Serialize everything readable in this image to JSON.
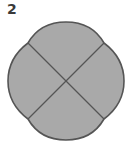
{
  "figure": {
    "label": "2",
    "shape": "circle divided into four sections with scalloped top and bottom",
    "colors": {
      "fill": "#a9a9a9",
      "stroke": "#555555",
      "label": "#3a3a3a"
    },
    "sections": 4
  }
}
